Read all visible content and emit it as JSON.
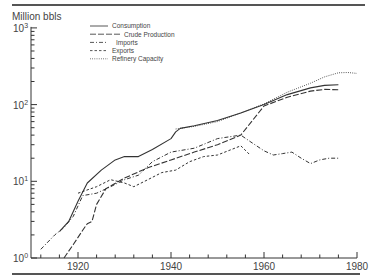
{
  "chart_data": {
    "type": "line",
    "title": "",
    "ylabel": "Million bbls",
    "xlabel": "",
    "yscale": "log",
    "ylim": [
      1,
      1000
    ],
    "xlim": [
      1910,
      1980
    ],
    "x_ticks": [
      1920,
      1940,
      1960,
      1980
    ],
    "y_ticks": [
      "10^0",
      "10^1",
      "10^2",
      "10^3"
    ],
    "grid": false,
    "legend_position": "upper-left-inside",
    "series": [
      {
        "name": "Consumption",
        "style": "solid",
        "points": [
          [
            1916,
            2.2
          ],
          [
            1918,
            3.0
          ],
          [
            1920,
            5.5
          ],
          [
            1922,
            9.5
          ],
          [
            1925,
            14
          ],
          [
            1928,
            19
          ],
          [
            1930,
            21
          ],
          [
            1933,
            21
          ],
          [
            1936,
            26
          ],
          [
            1940,
            36
          ],
          [
            1941,
            44
          ],
          [
            1942,
            49
          ],
          [
            1945,
            53
          ],
          [
            1950,
            62
          ],
          [
            1955,
            78
          ],
          [
            1960,
            100
          ],
          [
            1965,
            135
          ],
          [
            1970,
            165
          ],
          [
            1973,
            178
          ],
          [
            1976,
            182
          ]
        ]
      },
      {
        "name": "Crude Production",
        "style": "long-dash",
        "points": [
          [
            1917,
            1.0
          ],
          [
            1919,
            1.5
          ],
          [
            1921,
            2.3
          ],
          [
            1922,
            2.8
          ],
          [
            1923,
            3.0
          ],
          [
            1924,
            5.0
          ],
          [
            1926,
            8.0
          ],
          [
            1930,
            11
          ],
          [
            1935,
            15
          ],
          [
            1940,
            19
          ],
          [
            1945,
            24
          ],
          [
            1950,
            30
          ],
          [
            1955,
            40
          ],
          [
            1960,
            96
          ],
          [
            1965,
            125
          ],
          [
            1970,
            150
          ],
          [
            1973,
            158
          ],
          [
            1976,
            156
          ]
        ]
      },
      {
        "name": "Imports",
        "style": "dash-dot",
        "points": [
          [
            1912,
            1.3
          ],
          [
            1915,
            2.0
          ],
          [
            1917,
            2.5
          ],
          [
            1919,
            3.5
          ],
          [
            1921,
            6.5
          ],
          [
            1924,
            7.0
          ],
          [
            1927,
            8.5
          ],
          [
            1930,
            10.5
          ],
          [
            1933,
            12
          ],
          [
            1936,
            18
          ],
          [
            1940,
            24
          ],
          [
            1945,
            27
          ],
          [
            1950,
            36
          ],
          [
            1955,
            40
          ],
          [
            1957,
            33
          ],
          [
            1960,
            25
          ],
          [
            1962,
            22
          ],
          [
            1964,
            23
          ],
          [
            1966,
            24
          ],
          [
            1968,
            20
          ],
          [
            1970,
            17
          ],
          [
            1972,
            19
          ],
          [
            1974,
            20
          ],
          [
            1976,
            20
          ]
        ]
      },
      {
        "name": "Exports",
        "style": "dashed",
        "points": [
          [
            1920,
            7.0
          ],
          [
            1924,
            8.5
          ],
          [
            1927,
            10.5
          ],
          [
            1930,
            9.5
          ],
          [
            1932,
            8.5
          ],
          [
            1935,
            10.5
          ],
          [
            1938,
            13
          ],
          [
            1941,
            14
          ],
          [
            1944,
            18
          ],
          [
            1947,
            21
          ],
          [
            1950,
            22
          ],
          [
            1953,
            26
          ],
          [
            1955,
            29
          ],
          [
            1957,
            22
          ]
        ]
      },
      {
        "name": "Refinery Capacity",
        "style": "dotted",
        "points": [
          [
            1941,
            48
          ],
          [
            1945,
            52
          ],
          [
            1950,
            60
          ],
          [
            1955,
            78
          ],
          [
            1960,
            102
          ],
          [
            1965,
            145
          ],
          [
            1970,
            190
          ],
          [
            1973,
            230
          ],
          [
            1976,
            260
          ],
          [
            1978,
            262
          ],
          [
            1980,
            255
          ]
        ]
      }
    ]
  },
  "axis": {
    "ylabel": "Million bbls",
    "y_tick_labels": [
      {
        "base": "10",
        "exp": "3"
      },
      {
        "base": "10",
        "exp": "2"
      },
      {
        "base": "10",
        "exp": "1"
      },
      {
        "base": "10",
        "exp": "0"
      }
    ],
    "x_tick_labels": [
      "1920",
      "1940",
      "1960",
      "1980"
    ]
  },
  "legend": [
    {
      "label": "Consumption"
    },
    {
      "label": "Crude Production"
    },
    {
      "label": "Imports"
    },
    {
      "label": "Exports"
    },
    {
      "label": "Refinery Capacity"
    }
  ]
}
